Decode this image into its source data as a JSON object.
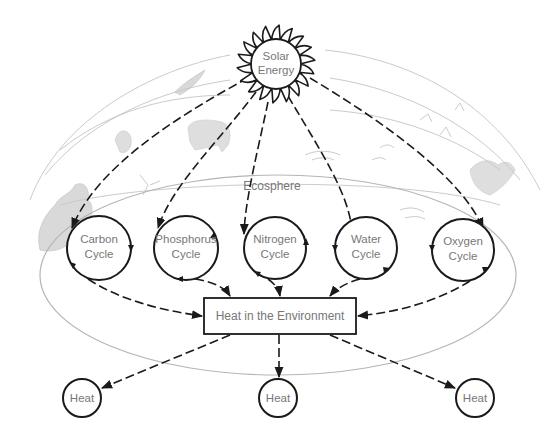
{
  "diagram": {
    "source": {
      "label_line1": "Solar",
      "label_line2": "Energy",
      "icon": "sun-icon"
    },
    "region_label": "Ecosphere",
    "cycles": [
      {
        "id": "carbon",
        "line1": "Carbon",
        "line2": "Cycle"
      },
      {
        "id": "phosphorus",
        "line1": "Phosphorus",
        "line2": "Cycle"
      },
      {
        "id": "nitrogen",
        "line1": "Nitrogen",
        "line2": "Cycle"
      },
      {
        "id": "water",
        "line1": "Water",
        "line2": "Cycle"
      },
      {
        "id": "oxygen",
        "line1": "Oxygen",
        "line2": "Cycle"
      }
    ],
    "sink": {
      "label": "Heat in the Environment"
    },
    "outputs": [
      {
        "label": "Heat"
      },
      {
        "label": "Heat"
      },
      {
        "label": "Heat"
      }
    ],
    "colors": {
      "line": "#1a1a1a",
      "text": "#777777",
      "sketch": "#bdbdbd",
      "background": "#ffffff"
    }
  }
}
